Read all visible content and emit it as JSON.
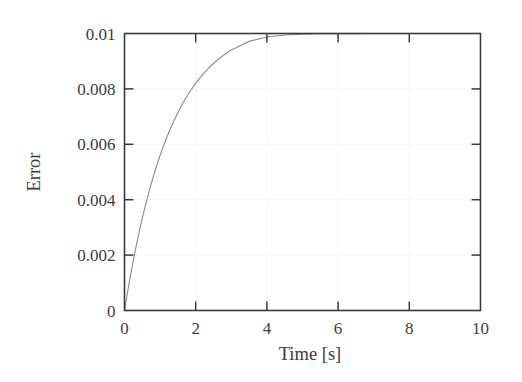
{
  "chart_data": {
    "type": "line",
    "title": "",
    "subtitle": "",
    "xlabel": "Time [s]",
    "ylabel": "Error",
    "xlim": [
      0,
      10
    ],
    "ylim": [
      0,
      0.01
    ],
    "grid": true,
    "legend": null,
    "legend_position": "none",
    "x_ticks": [
      0,
      2,
      4,
      6,
      8,
      10
    ],
    "x_tick_labels": [
      "0",
      "2",
      "4",
      "6",
      "8",
      "10"
    ],
    "y_ticks": [
      0,
      0.002,
      0.004,
      0.006,
      0.008,
      0.01
    ],
    "y_tick_labels": [
      "0",
      "0.002",
      "0.004",
      "0.006",
      "0.008",
      "0.01"
    ],
    "series": [
      {
        "name": "Error",
        "color": "#8f8f8f",
        "description": "Exponential saturation approaching 0.01",
        "x": [
          0,
          0.1,
          0.2,
          0.3,
          0.4,
          0.5,
          0.6,
          0.7,
          0.8,
          0.9,
          1.0,
          1.2,
          1.4,
          1.6,
          1.8,
          2.0,
          2.2,
          2.4,
          2.6,
          2.8,
          3.0,
          3.5,
          4.0,
          4.5,
          5.0,
          5.5,
          6.0,
          6.5,
          7.0,
          7.5,
          8.0,
          8.5,
          9.0,
          9.5,
          10.0
        ],
        "y": [
          0,
          0.000772,
          0.001487,
          0.002149,
          0.002762,
          0.003331,
          0.003857,
          0.004345,
          0.004797,
          0.005216,
          0.005604,
          0.006297,
          0.00689,
          0.007398,
          0.007833,
          0.008206,
          0.008526,
          0.0088,
          0.009034,
          0.009235,
          0.009408,
          0.009716,
          0.009872,
          0.009944,
          0.009975,
          0.009989,
          0.009995,
          0.009998,
          0.009999,
          0.01,
          0.01,
          0.01,
          0.01,
          0.01,
          0.01
        ]
      }
    ],
    "annotations": []
  },
  "axis": {
    "y_title": "Error",
    "x_title": "Time [s]"
  }
}
